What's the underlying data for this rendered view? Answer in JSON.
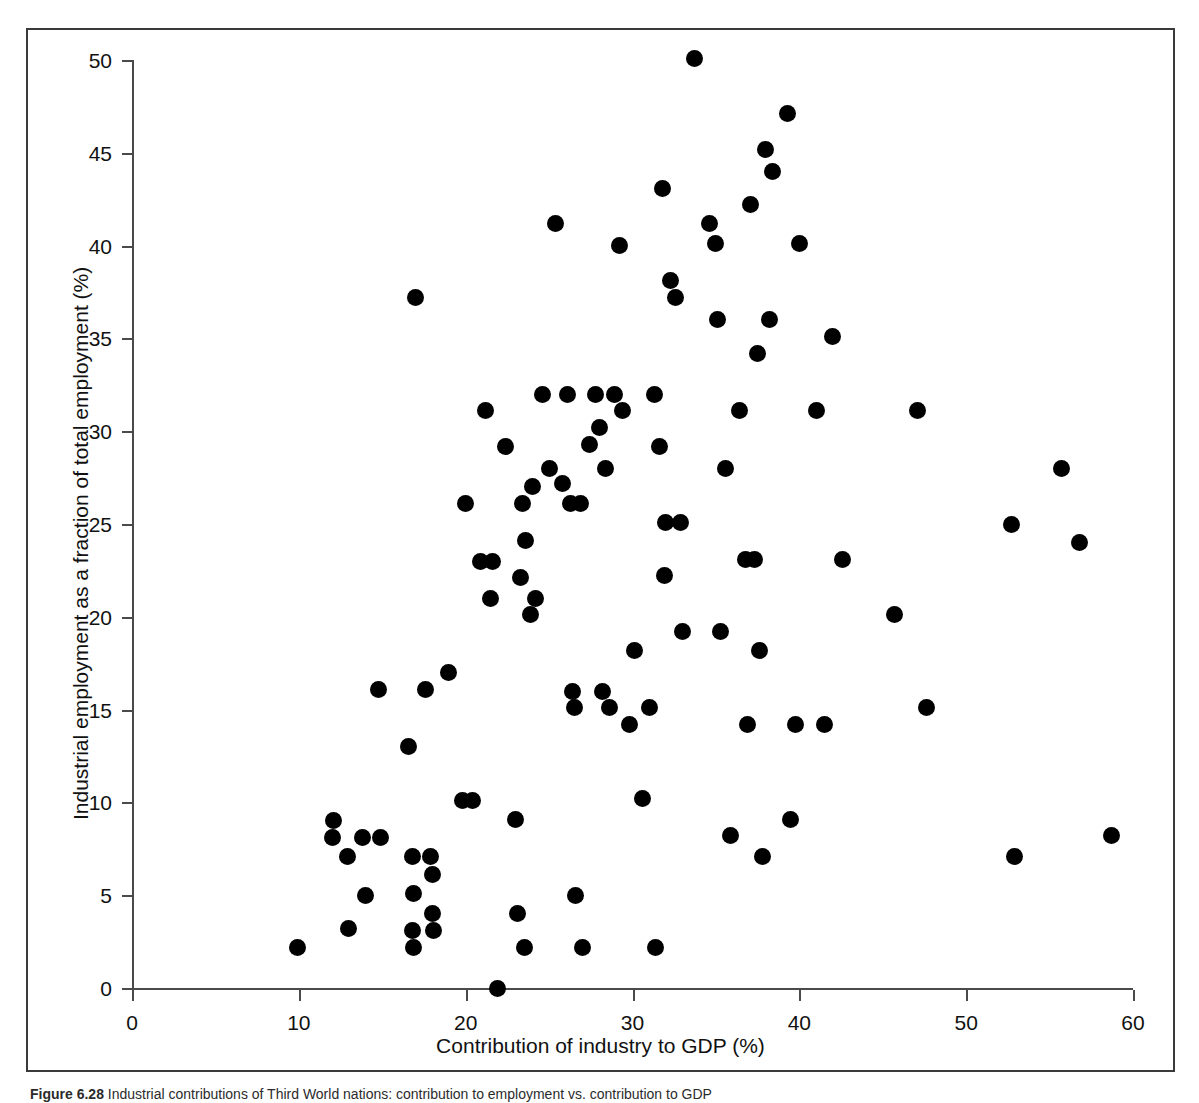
{
  "figure": {
    "caption_label": "Figure 6.28",
    "caption_text": "Industrial contributions of Third World nations: contribution to employment vs. contribution to GDP"
  },
  "chart_data": {
    "type": "scatter",
    "title": "",
    "xlabel": "Contribution of industry to GDP (%)",
    "ylabel": "Industrial employment as a fraction of total employment (%)",
    "xlim": [
      0,
      60
    ],
    "ylim": [
      0,
      50
    ],
    "xticks": [
      0,
      10,
      20,
      30,
      40,
      50,
      60
    ],
    "yticks": [
      0,
      5,
      10,
      15,
      20,
      25,
      30,
      35,
      40,
      45,
      50
    ],
    "grid": false,
    "legend": false,
    "marker": "filled-circle",
    "marker_color": "#000000",
    "n_points": 118,
    "points": [
      [
        9.9,
        2.2
      ],
      [
        12.1,
        9.0
      ],
      [
        12.0,
        8.1
      ],
      [
        12.9,
        7.1
      ],
      [
        13.0,
        3.2
      ],
      [
        13.8,
        8.1
      ],
      [
        14.0,
        5.0
      ],
      [
        14.9,
        8.1
      ],
      [
        14.8,
        16.1
      ],
      [
        16.6,
        13.0
      ],
      [
        16.8,
        7.1
      ],
      [
        16.9,
        5.1
      ],
      [
        16.8,
        3.1
      ],
      [
        16.9,
        2.2
      ],
      [
        17.0,
        37.2
      ],
      [
        17.6,
        16.1
      ],
      [
        17.9,
        7.1
      ],
      [
        18.0,
        6.1
      ],
      [
        18.0,
        4.0
      ],
      [
        18.1,
        3.1
      ],
      [
        19.0,
        17.0
      ],
      [
        19.8,
        10.1
      ],
      [
        20.0,
        26.1
      ],
      [
        20.4,
        10.1
      ],
      [
        20.9,
        23.0
      ],
      [
        21.2,
        31.1
      ],
      [
        21.5,
        21.0
      ],
      [
        21.6,
        23.0
      ],
      [
        21.9,
        0.0
      ],
      [
        22.4,
        29.2
      ],
      [
        23.0,
        9.1
      ],
      [
        23.1,
        4.0
      ],
      [
        23.3,
        22.1
      ],
      [
        23.4,
        26.1
      ],
      [
        23.5,
        2.2
      ],
      [
        23.6,
        24.1
      ],
      [
        23.9,
        20.1
      ],
      [
        24.0,
        27.0
      ],
      [
        24.2,
        21.0
      ],
      [
        24.6,
        32.0
      ],
      [
        25.0,
        28.0
      ],
      [
        25.4,
        41.2
      ],
      [
        25.8,
        27.2
      ],
      [
        26.1,
        32.0
      ],
      [
        26.3,
        26.1
      ],
      [
        26.4,
        16.0
      ],
      [
        26.5,
        15.1
      ],
      [
        26.6,
        5.0
      ],
      [
        26.9,
        26.1
      ],
      [
        27.0,
        2.2
      ],
      [
        27.4,
        29.3
      ],
      [
        27.8,
        32.0
      ],
      [
        28.0,
        30.2
      ],
      [
        28.2,
        16.0
      ],
      [
        28.4,
        28.0
      ],
      [
        28.6,
        15.1
      ],
      [
        28.9,
        32.0
      ],
      [
        29.2,
        40.0
      ],
      [
        29.4,
        31.1
      ],
      [
        29.8,
        14.2
      ],
      [
        30.1,
        18.2
      ],
      [
        30.6,
        10.2
      ],
      [
        31.0,
        15.1
      ],
      [
        31.3,
        32.0
      ],
      [
        31.4,
        2.2
      ],
      [
        31.6,
        29.2
      ],
      [
        31.8,
        43.1
      ],
      [
        31.9,
        22.2
      ],
      [
        32.0,
        25.1
      ],
      [
        32.3,
        38.1
      ],
      [
        32.6,
        37.2
      ],
      [
        32.9,
        25.1
      ],
      [
        33.0,
        19.2
      ],
      [
        33.7,
        50.1
      ],
      [
        34.6,
        41.2
      ],
      [
        35.0,
        40.1
      ],
      [
        35.1,
        36.0
      ],
      [
        35.3,
        19.2
      ],
      [
        35.6,
        28.0
      ],
      [
        35.9,
        8.2
      ],
      [
        36.4,
        31.1
      ],
      [
        36.8,
        23.1
      ],
      [
        36.9,
        14.2
      ],
      [
        37.1,
        42.2
      ],
      [
        37.3,
        23.1
      ],
      [
        37.5,
        34.2
      ],
      [
        37.6,
        18.2
      ],
      [
        37.8,
        7.1
      ],
      [
        38.0,
        45.2
      ],
      [
        38.2,
        36.0
      ],
      [
        38.4,
        44.0
      ],
      [
        39.3,
        47.1
      ],
      [
        39.5,
        9.1
      ],
      [
        39.8,
        14.2
      ],
      [
        40.0,
        40.1
      ],
      [
        41.0,
        31.1
      ],
      [
        41.5,
        14.2
      ],
      [
        42.0,
        35.1
      ],
      [
        42.6,
        23.1
      ],
      [
        45.7,
        20.1
      ],
      [
        47.1,
        31.1
      ],
      [
        47.6,
        15.1
      ],
      [
        52.7,
        25.0
      ],
      [
        52.9,
        7.1
      ],
      [
        55.7,
        28.0
      ],
      [
        56.8,
        24.0
      ],
      [
        58.7,
        8.2
      ]
    ]
  }
}
